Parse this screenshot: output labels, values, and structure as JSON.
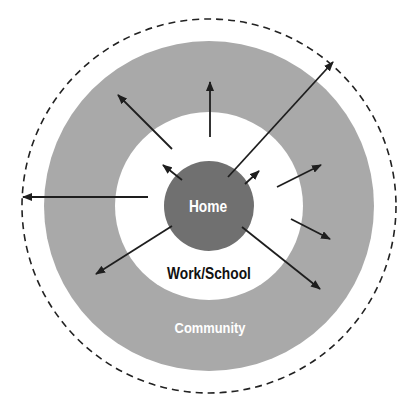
{
  "diagram": {
    "type": "concentric-circles",
    "center": {
      "x": 209,
      "y": 206
    },
    "colors": {
      "background": "#ffffff",
      "community_ring": "#a9a9a9",
      "work_school_ring": "#ffffff",
      "home_circle": "#707070",
      "arrow": "#1e1e1e",
      "dashed_boundary": "#222222",
      "home_label": "#ffffff",
      "work_school_label": "#111111",
      "community_label": "#ffffff"
    },
    "rings": {
      "boundary_radius": 187,
      "community_outer_radius": 165,
      "community_inner_radius": 94,
      "home_radius": 45
    },
    "labels": {
      "home": "Home",
      "work_school": "Work/School",
      "community": "Community"
    },
    "arrows": [
      {
        "name": "arrow-upper-left",
        "x1": 172,
        "y1": 149,
        "x2": 118,
        "y2": 95
      },
      {
        "name": "arrow-up",
        "x1": 210,
        "y1": 137,
        "x2": 210,
        "y2": 82
      },
      {
        "name": "arrow-long-upper-right",
        "x1": 228,
        "y1": 177,
        "x2": 333,
        "y2": 62
      },
      {
        "name": "arrow-small-upper-left",
        "x1": 182,
        "y1": 180,
        "x2": 163,
        "y2": 165
      },
      {
        "name": "arrow-small-upper-right",
        "x1": 245,
        "y1": 184,
        "x2": 259,
        "y2": 171
      },
      {
        "name": "arrow-right",
        "x1": 277,
        "y1": 187,
        "x2": 321,
        "y2": 165
      },
      {
        "name": "arrow-left-long",
        "x1": 148,
        "y1": 197,
        "x2": 23,
        "y2": 197
      },
      {
        "name": "arrow-lower-right-short",
        "x1": 291,
        "y1": 219,
        "x2": 330,
        "y2": 239
      },
      {
        "name": "arrow-lower-right",
        "x1": 242,
        "y1": 227,
        "x2": 320,
        "y2": 289
      },
      {
        "name": "arrow-lower-left",
        "x1": 172,
        "y1": 226,
        "x2": 96,
        "y2": 274
      }
    ]
  }
}
